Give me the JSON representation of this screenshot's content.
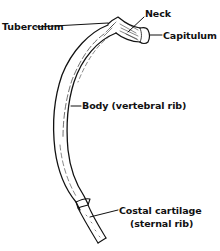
{
  "diagram": {
    "subject": "Rib",
    "labels": {
      "tuberculum": "Tuberculum",
      "neck": "Neck",
      "capitulum": "Capitulum",
      "body": "Body (vertebral rib)",
      "costal_line1": "Costal cartilage",
      "costal_line2": "(sternal rib)"
    },
    "colors": {
      "ink": "#111111",
      "background": "#ffffff"
    }
  }
}
